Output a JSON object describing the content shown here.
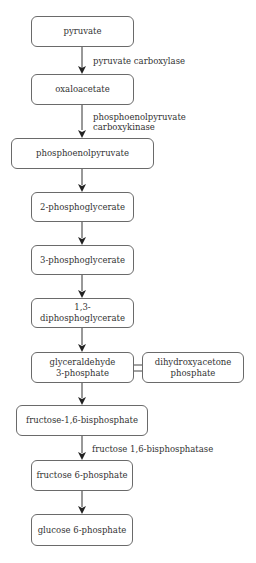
{
  "diagram": {
    "type": "metabolic-pathway-flowchart",
    "nodes": [
      {
        "id": "pyruvate",
        "label": "pyruvate"
      },
      {
        "id": "oxaloacetate",
        "label": "oxaloacetate"
      },
      {
        "id": "pep",
        "label": "phosphoenolpyruvate"
      },
      {
        "id": "pg2",
        "label": "2-phosphoglycerate"
      },
      {
        "id": "pg3",
        "label": "3-phosphoglycerate"
      },
      {
        "id": "dpg13",
        "label": "1,3-diphosphoglycerate"
      },
      {
        "id": "g3p",
        "label": "glyceraldehyde\n3-phosphate"
      },
      {
        "id": "dhap",
        "label": "dihydroxyacetone\nphosphate"
      },
      {
        "id": "f16bp",
        "label": "fructose-1,6-bisphosphate"
      },
      {
        "id": "f6p",
        "label": "fructose 6-phosphate"
      },
      {
        "id": "g6p",
        "label": "glucose 6-phosphate"
      }
    ],
    "edges": [
      {
        "from": "pyruvate",
        "to": "oxaloacetate",
        "enzyme": "pyruvate carboxylase"
      },
      {
        "from": "oxaloacetate",
        "to": "pep",
        "enzyme": "phosphoenolpyruvate\ncarboxykinase"
      },
      {
        "from": "pep",
        "to": "pg2",
        "enzyme": ""
      },
      {
        "from": "pg2",
        "to": "pg3",
        "enzyme": ""
      },
      {
        "from": "pg3",
        "to": "dpg13",
        "enzyme": ""
      },
      {
        "from": "dpg13",
        "to": "g3p",
        "enzyme": ""
      },
      {
        "from": "g3p",
        "to": "dhap",
        "enzyme": "",
        "bidirectional": true
      },
      {
        "from": "g3p",
        "to": "f16bp",
        "enzyme": ""
      },
      {
        "from": "f16bp",
        "to": "f6p",
        "enzyme": "fructose 1,6-bisphosphatase"
      },
      {
        "from": "f6p",
        "to": "g6p",
        "enzyme": ""
      }
    ],
    "colors": {
      "stroke": "#6a6a6a",
      "arrow": "#222222",
      "text": "#333333"
    }
  }
}
